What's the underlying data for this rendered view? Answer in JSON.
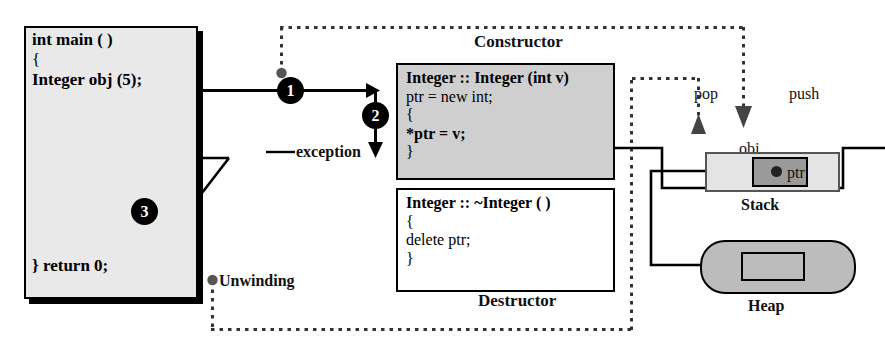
{
  "diagram": {
    "colors": {
      "ink": "#000000",
      "main_box_fill": "#e9e9e9",
      "ctor_fill": "#cfcfcf",
      "dtor_fill": "#ffffff",
      "stack_fill": "#e4e4e4",
      "stack_cell_fill": "#9a9a9a",
      "heap_fill": "#bcbcbc"
    }
  },
  "main_function": {
    "name": "main-code-box",
    "lines": [
      "int main ( )",
      "{",
      "Integer obj (5);"
    ],
    "return_line": "}  return 0;"
  },
  "constructor": {
    "caption": "Constructor",
    "lines": [
      "Integer :: Integer (int v)",
      "ptr = new int;",
      "{",
      "   *ptr = v;",
      "}"
    ]
  },
  "destructor": {
    "caption": "Destructor",
    "lines": [
      "Integer :: ~Integer ( )",
      "{",
      "   delete ptr;",
      "}"
    ]
  },
  "steps": [
    {
      "id": "1",
      "label": "1"
    },
    {
      "id": "2",
      "label": "2"
    },
    {
      "id": "3",
      "label": "3"
    }
  ],
  "annotations": {
    "exception": "exception",
    "unwinding": "Unwinding",
    "pop": "pop",
    "push": "push"
  },
  "memory": {
    "stack": {
      "caption": "Stack",
      "object_label": "obj",
      "pointer_label": "ptr"
    },
    "heap": {
      "caption": "Heap"
    }
  }
}
